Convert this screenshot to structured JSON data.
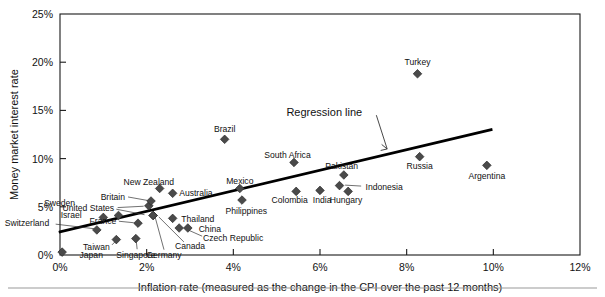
{
  "chart_data": {
    "type": "scatter",
    "title": "",
    "xlabel": "Inflation rate (measured as the change in the CPI over the past 12 months)",
    "ylabel": "Money market interest rate",
    "xlim": [
      0,
      12
    ],
    "ylim": [
      0,
      25
    ],
    "grid": false,
    "legend": null,
    "xticks": [
      "0%",
      "2%",
      "4%",
      "6%",
      "8%",
      "10%",
      "12%"
    ],
    "xtick_values": [
      0,
      2,
      4,
      6,
      8,
      10,
      12
    ],
    "yticks": [
      "0%",
      "5%",
      "10%",
      "15%",
      "20%",
      "25%"
    ],
    "ytick_values": [
      0,
      5,
      10,
      15,
      20,
      25
    ],
    "points": [
      {
        "label": "Japan",
        "x": 0.05,
        "y": 0.3,
        "lx": 0.45,
        "ly": 0.0,
        "anchor": "start"
      },
      {
        "label": "Switzerland",
        "x": 0.85,
        "y": 2.6,
        "lx": -0.25,
        "ly": 3.3,
        "anchor": "end"
      },
      {
        "label": "Sweden",
        "x": 1.35,
        "y": 4.1,
        "lx": 0.35,
        "ly": 5.4,
        "anchor": "end"
      },
      {
        "label": "Israel",
        "x": 1.0,
        "y": 3.9,
        "lx": 0.5,
        "ly": 4.2,
        "anchor": "end"
      },
      {
        "label": "Taiwan",
        "x": 1.3,
        "y": 1.6,
        "lx": 1.15,
        "ly": 0.85,
        "anchor": "end"
      },
      {
        "label": "Singapore",
        "x": 1.75,
        "y": 1.7,
        "lx": 1.75,
        "ly": 0.0,
        "anchor": "middle"
      },
      {
        "label": "United States",
        "x": 2.05,
        "y": 5.1,
        "lx": 1.25,
        "ly": 4.9,
        "anchor": "end"
      },
      {
        "label": "Britain",
        "x": 2.1,
        "y": 5.6,
        "lx": 1.5,
        "ly": 6.0,
        "anchor": "end"
      },
      {
        "label": "France",
        "x": 1.8,
        "y": 3.3,
        "lx": 1.3,
        "ly": 3.5,
        "anchor": "end"
      },
      {
        "label": "New Zealand",
        "x": 2.3,
        "y": 6.9,
        "lx": 2.05,
        "ly": 7.6,
        "anchor": "middle"
      },
      {
        "label": "Australia",
        "x": 2.6,
        "y": 6.4,
        "lx": 2.75,
        "ly": 6.4,
        "anchor": "start"
      },
      {
        "label": "Germany",
        "x": 2.15,
        "y": 4.1,
        "lx": 2.4,
        "ly": 0.0,
        "anchor": "middle"
      },
      {
        "label": "Canada",
        "x": 2.15,
        "y": 4.1,
        "lx": 3.0,
        "ly": 0.9,
        "anchor": "middle"
      },
      {
        "label": "Thailand",
        "x": 2.6,
        "y": 3.8,
        "lx": 2.8,
        "ly": 3.7,
        "anchor": "start"
      },
      {
        "label": "China",
        "x": 2.95,
        "y": 2.8,
        "lx": 3.2,
        "ly": 2.7,
        "anchor": "start"
      },
      {
        "label": "Czech Republic",
        "x": 2.75,
        "y": 2.8,
        "lx": 3.3,
        "ly": 1.8,
        "anchor": "start"
      },
      {
        "label": "Brazil",
        "x": 3.8,
        "y": 12.0,
        "lx": 3.8,
        "ly": 13.1,
        "anchor": "middle"
      },
      {
        "label": "Mexico",
        "x": 4.15,
        "y": 6.9,
        "lx": 4.15,
        "ly": 7.7,
        "anchor": "middle"
      },
      {
        "label": "Philippines",
        "x": 4.2,
        "y": 5.7,
        "lx": 4.3,
        "ly": 4.6,
        "anchor": "middle"
      },
      {
        "label": "South Africa",
        "x": 5.4,
        "y": 9.6,
        "lx": 5.25,
        "ly": 10.4,
        "anchor": "middle"
      },
      {
        "label": "Colombia",
        "x": 5.45,
        "y": 6.6,
        "lx": 5.3,
        "ly": 5.7,
        "anchor": "middle"
      },
      {
        "label": "India",
        "x": 6.0,
        "y": 6.7,
        "lx": 6.05,
        "ly": 5.7,
        "anchor": "middle"
      },
      {
        "label": "Pakistan",
        "x": 6.55,
        "y": 8.3,
        "lx": 6.5,
        "ly": 9.2,
        "anchor": "middle"
      },
      {
        "label": "Indonesia",
        "x": 6.45,
        "y": 7.2,
        "lx": 7.05,
        "ly": 7.1,
        "anchor": "start"
      },
      {
        "label": "Hungary",
        "x": 6.65,
        "y": 6.6,
        "lx": 6.6,
        "ly": 5.7,
        "anchor": "middle"
      },
      {
        "label": "Turkey",
        "x": 8.25,
        "y": 18.8,
        "lx": 8.25,
        "ly": 20.0,
        "anchor": "middle"
      },
      {
        "label": "Russia",
        "x": 8.3,
        "y": 10.2,
        "lx": 8.3,
        "ly": 9.2,
        "anchor": "middle"
      },
      {
        "label": "Argentina",
        "x": 9.85,
        "y": 9.3,
        "lx": 9.85,
        "ly": 8.2,
        "anchor": "middle"
      }
    ],
    "regression_line": {
      "label": "Regression line",
      "x_start": 0.0,
      "y_start": 2.4,
      "x_end": 9.95,
      "y_end": 13.0,
      "annotation_x": 6.1,
      "annotation_y": 14.4
    }
  }
}
